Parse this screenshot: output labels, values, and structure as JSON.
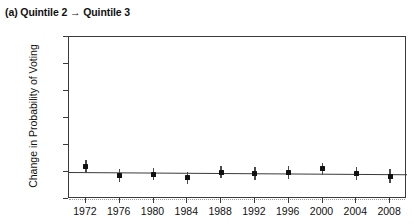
{
  "panel": {
    "label": "(a)",
    "title": "(a) Quintile 2 → Quintile 3"
  },
  "axes": {
    "ylabel": "Change in Probability of Voting",
    "xlabel": "",
    "yticks": [
      "0.00",
      "0.05",
      "0.10",
      "0.15",
      "0.20",
      "0.25",
      "0.30"
    ],
    "ytick_values": [
      0.0,
      0.05,
      0.1,
      0.15,
      0.2,
      0.25,
      0.3
    ],
    "ylim": [
      0.0,
      0.3
    ],
    "xticks": [
      "1972",
      "1976",
      "1980",
      "1984",
      "1988",
      "1992",
      "1996",
      "2000",
      "2004",
      "2008"
    ],
    "xlim": [
      1970,
      2010
    ]
  },
  "colors": {
    "point": "#111111",
    "errorbar": "#4a4a4a",
    "fitline": "#3a3a3a",
    "zeroline": "#9a9a9a",
    "frame": "#3a3a3a",
    "background": "#ffffff"
  },
  "chart_data": {
    "type": "scatter",
    "title": "(a) Quintile 2 → Quintile 3",
    "xlabel": "",
    "ylabel": "Change in Probability of Voting",
    "ylim": [
      0.0,
      0.3
    ],
    "xlim": [
      1970,
      2010
    ],
    "grid": false,
    "legend": null,
    "x": [
      1972,
      1976,
      1980,
      1984,
      1988,
      1992,
      1996,
      2000,
      2004,
      2008
    ],
    "categories": [
      "1972",
      "1976",
      "1980",
      "1984",
      "1988",
      "1992",
      "1996",
      "2000",
      "2004",
      "2008"
    ],
    "values": [
      0.061,
      0.043,
      0.046,
      0.039,
      0.05,
      0.047,
      0.049,
      0.056,
      0.047,
      0.042
    ],
    "error_low": [
      0.049,
      0.031,
      0.035,
      0.028,
      0.039,
      0.035,
      0.037,
      0.045,
      0.035,
      0.029
    ],
    "error_high": [
      0.073,
      0.055,
      0.057,
      0.05,
      0.061,
      0.059,
      0.061,
      0.067,
      0.059,
      0.055
    ],
    "series": [
      {
        "name": "Change in Probability of Voting",
        "values": [
          0.061,
          0.043,
          0.046,
          0.039,
          0.05,
          0.047,
          0.049,
          0.056,
          0.047,
          0.042
        ]
      }
    ],
    "reference_lines": [
      {
        "name": "zero-line",
        "y": 0.0,
        "style": "dotted"
      },
      {
        "name": "fit-line",
        "y_start": 0.0505,
        "y_end": 0.0465,
        "style": "solid"
      }
    ],
    "annotations": []
  }
}
